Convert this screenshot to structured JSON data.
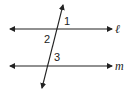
{
  "diagram": {
    "type": "parallel-lines-transversal",
    "lines": [
      {
        "name": "l",
        "label": "ℓ",
        "y": 29
      },
      {
        "name": "m",
        "label": "m",
        "y": 66
      }
    ],
    "transversal": {
      "x1": 63,
      "y1": 5,
      "x2": 42,
      "y2": 88
    },
    "angles": [
      {
        "label": "1",
        "x": 65,
        "y": 24
      },
      {
        "label": "2",
        "x": 45,
        "y": 42
      },
      {
        "label": "3",
        "x": 54,
        "y": 60
      }
    ],
    "colors": {
      "stroke": "#222222",
      "background": "#ffffff"
    }
  }
}
